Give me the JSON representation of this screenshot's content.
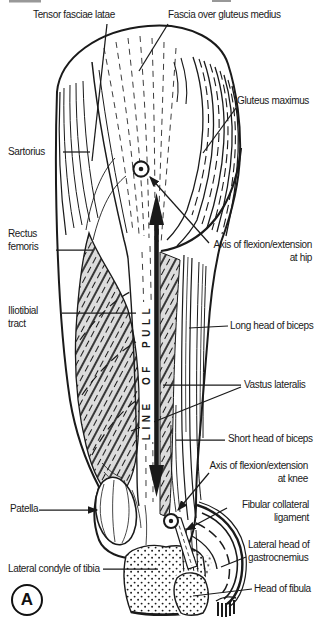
{
  "figure": {
    "panel_letter": "A",
    "line_of_pull_text": "LINE OF PULL",
    "colors": {
      "ink": "#1a1a1a",
      "paper": "#ffffff",
      "muscle_shade": "#dcdcdc"
    },
    "labels": {
      "tensor_fasciae_latae": "Tensor fasciae latae",
      "fascia_over_gluteus_medius": "Fascia over gluteus medius",
      "gluteus_maximus": "Gluteus maximus",
      "sartorius": "Sartorius",
      "rectus_femoris_line1": "Rectus",
      "rectus_femoris_line2": "femoris",
      "axis_hip_line1": "Axis of flexion/extension",
      "axis_hip_line2": "at hip",
      "iliotibial_line1": "Iliotibial",
      "iliotibial_line2": "tract",
      "long_head_of_biceps": "Long head of biceps",
      "vastus_lateralis": "Vastus lateralis",
      "short_head_of_biceps": "Short head of biceps",
      "axis_knee_line1": "Axis of flexion/extension",
      "axis_knee_line2": "at knee",
      "patella": "Patella",
      "fibular_collateral_line1": "Fibular collateral",
      "fibular_collateral_line2": "ligament",
      "gastrocnemius_line1": "Lateral head of",
      "gastrocnemius_line2": "gastrocnemius",
      "lateral_condyle_of_tibia": "Lateral condyle of tibia",
      "head_of_fibula": "Head of fibula"
    }
  }
}
